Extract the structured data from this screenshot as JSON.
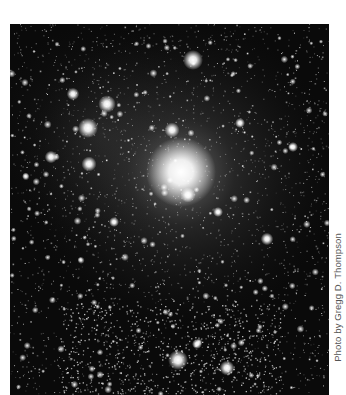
{
  "photo": {
    "subject": "star-cluster-astrophoto",
    "background_color": "#0a0a0a",
    "glow_center": {
      "x": 171,
      "y": 148,
      "radius": 70
    },
    "bright_stars": [
      {
        "x": 171,
        "y": 148,
        "r": 14
      },
      {
        "x": 183,
        "y": 36,
        "r": 4
      },
      {
        "x": 97,
        "y": 80,
        "r": 3.5
      },
      {
        "x": 78,
        "y": 104,
        "r": 4
      },
      {
        "x": 63,
        "y": 70,
        "r": 2.5
      },
      {
        "x": 79,
        "y": 140,
        "r": 3
      },
      {
        "x": 41,
        "y": 133,
        "r": 2.5
      },
      {
        "x": 162,
        "y": 106,
        "r": 3
      },
      {
        "x": 178,
        "y": 171,
        "r": 3
      },
      {
        "x": 208,
        "y": 188,
        "r": 2
      },
      {
        "x": 257,
        "y": 215,
        "r": 2.5
      },
      {
        "x": 168,
        "y": 336,
        "r": 4
      },
      {
        "x": 217,
        "y": 344,
        "r": 3
      },
      {
        "x": 187,
        "y": 320,
        "r": 2
      },
      {
        "x": 283,
        "y": 123,
        "r": 2
      },
      {
        "x": 104,
        "y": 198,
        "r": 2
      },
      {
        "x": 230,
        "y": 99,
        "r": 2
      }
    ],
    "cluster_region": {
      "x": 150,
      "y": 300,
      "w": 160,
      "h": 70
    }
  },
  "credit": {
    "text": "Photo by Gregg D. Thompson"
  }
}
